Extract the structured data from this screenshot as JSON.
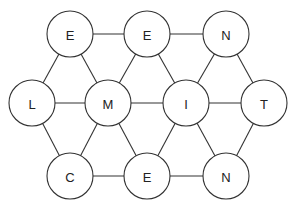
{
  "diagram": {
    "type": "letter-grid-graph",
    "radius": 23,
    "colors": {
      "stroke": "#333333",
      "fill": "#ffffff",
      "text": "#222222"
    },
    "nodes": [
      {
        "id": "n1",
        "label": "E",
        "x": 70,
        "y": 34
      },
      {
        "id": "n2",
        "label": "E",
        "x": 147,
        "y": 34
      },
      {
        "id": "n3",
        "label": "N",
        "x": 226,
        "y": 34
      },
      {
        "id": "n4",
        "label": "L",
        "x": 32,
        "y": 103
      },
      {
        "id": "n5",
        "label": "M",
        "x": 108,
        "y": 103
      },
      {
        "id": "n6",
        "label": "I",
        "x": 186,
        "y": 103
      },
      {
        "id": "n7",
        "label": "T",
        "x": 264,
        "y": 103
      },
      {
        "id": "n8",
        "label": "C",
        "x": 70,
        "y": 176
      },
      {
        "id": "n9",
        "label": "E",
        "x": 147,
        "y": 176
      },
      {
        "id": "n10",
        "label": "N",
        "x": 226,
        "y": 176
      }
    ],
    "edges": [
      [
        "n1",
        "n2"
      ],
      [
        "n2",
        "n3"
      ],
      [
        "n4",
        "n5"
      ],
      [
        "n5",
        "n6"
      ],
      [
        "n6",
        "n7"
      ],
      [
        "n8",
        "n9"
      ],
      [
        "n9",
        "n10"
      ],
      [
        "n1",
        "n4"
      ],
      [
        "n1",
        "n5"
      ],
      [
        "n2",
        "n5"
      ],
      [
        "n2",
        "n6"
      ],
      [
        "n3",
        "n6"
      ],
      [
        "n3",
        "n7"
      ],
      [
        "n8",
        "n4"
      ],
      [
        "n8",
        "n5"
      ],
      [
        "n9",
        "n5"
      ],
      [
        "n9",
        "n6"
      ],
      [
        "n10",
        "n6"
      ],
      [
        "n10",
        "n7"
      ]
    ]
  }
}
